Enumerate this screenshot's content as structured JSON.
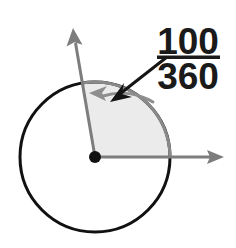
{
  "figure": {
    "background_color": "#ffffff"
  },
  "circle": {
    "center_x": 95,
    "center_y": 157,
    "radius": 75,
    "stroke_color": "#111111",
    "stroke_width": 3,
    "fill_color": "#ffffff"
  },
  "center_point": {
    "label": "center-dot",
    "radius": 6,
    "color": "#111111"
  },
  "sector": {
    "start_angle_deg": 0,
    "end_angle_deg": 100,
    "fill_color": "#ebebeb",
    "edge_color": "#8a8a8a",
    "measure_deg": 100,
    "full_circle_deg": 360
  },
  "rays": [
    {
      "name": "horizontal-ray",
      "angle_deg": 0,
      "tip_x": 224,
      "tip_y": 157,
      "color": "#7d7d7d",
      "width": 3
    },
    {
      "name": "angled-ray",
      "angle_deg": 100,
      "tip_x": 73,
      "tip_y": 28,
      "color": "#7d7d7d",
      "width": 3
    }
  ],
  "arc_arrow": {
    "name": "angle-arc-arrow",
    "color": "#8e8e8e",
    "width": 3,
    "direction": "counterclockwise"
  },
  "pointer_arrow": {
    "name": "callout-pointer",
    "from_x": 167,
    "from_y": 57,
    "to_x": 112,
    "to_y": 101,
    "color": "#141414",
    "width": 3
  },
  "fraction_label": {
    "numerator": "100",
    "denominator": "360",
    "bar_color": "#1a1a1a",
    "text_color": "#1a1a1a"
  }
}
